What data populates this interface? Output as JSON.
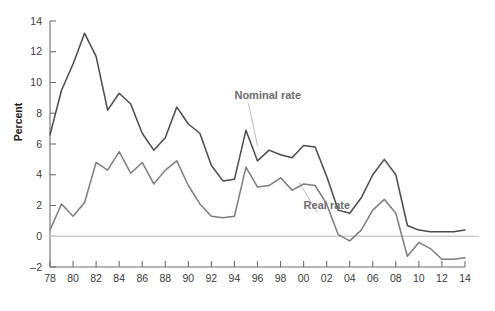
{
  "chart_data": {
    "type": "line",
    "title": "",
    "subtitle": "",
    "xlabel": "",
    "ylabel": "Percent",
    "ylim": [
      -2,
      14
    ],
    "yticks": [
      -2,
      0,
      2,
      4,
      6,
      8,
      10,
      12,
      14
    ],
    "ytick_labels": [
      "–2",
      "0",
      "2",
      "4",
      "6",
      "8",
      "10",
      "12",
      "14"
    ],
    "xlim": [
      1978,
      2014
    ],
    "xticks": [
      1978,
      1980,
      1982,
      1984,
      1986,
      1988,
      1990,
      1992,
      1994,
      1996,
      1998,
      2000,
      2002,
      2004,
      2006,
      2008,
      2010,
      2012,
      2014
    ],
    "xtick_labels": [
      "78",
      "80",
      "82",
      "84",
      "86",
      "88",
      "90",
      "92",
      "94",
      "96",
      "98",
      "00",
      "02",
      "04",
      "06",
      "08",
      "10",
      "12",
      "14"
    ],
    "grid": false,
    "legend_position": "inline-annotation",
    "zero_reference_line": 0,
    "x": [
      1978,
      1979,
      1980,
      1981,
      1982,
      1983,
      1984,
      1985,
      1986,
      1987,
      1988,
      1989,
      1990,
      1991,
      1992,
      1993,
      1994,
      1995,
      1996,
      1997,
      1998,
      1999,
      2000,
      2001,
      2002,
      2003,
      2004,
      2005,
      2006,
      2007,
      2008,
      2009,
      2010,
      2011,
      2012,
      2013,
      2014
    ],
    "series": [
      {
        "name": "Nominal rate",
        "color": "#4a4a4a",
        "values": [
          6.6,
          9.5,
          11.2,
          13.2,
          11.7,
          8.2,
          9.3,
          8.6,
          6.7,
          5.6,
          6.4,
          8.4,
          7.3,
          6.7,
          4.6,
          3.6,
          3.7,
          6.9,
          4.9,
          5.6,
          5.3,
          5.1,
          5.9,
          5.8,
          3.9,
          1.7,
          1.5,
          2.5,
          4.0,
          5.0,
          4.0,
          0.7,
          0.4,
          0.3,
          0.3,
          0.3,
          0.4
        ]
      },
      {
        "name": "Real rate",
        "color": "#7d7d7d",
        "values": [
          0.4,
          2.1,
          1.3,
          2.2,
          4.8,
          4.3,
          5.5,
          4.1,
          4.8,
          3.4,
          4.3,
          4.9,
          3.3,
          2.1,
          1.3,
          1.2,
          1.3,
          4.5,
          3.2,
          3.3,
          3.8,
          3.0,
          3.4,
          3.3,
          2.1,
          0.1,
          -0.3,
          0.4,
          1.7,
          2.4,
          1.5,
          -1.3,
          -0.4,
          -0.8,
          -1.5,
          -1.5,
          -1.4
        ]
      }
    ],
    "annotations": [
      {
        "text": "Nominal rate",
        "x": 1994.0,
        "y": 8.9,
        "leader_to_x": 1996.0,
        "leader_to_y": 5.9
      },
      {
        "text": "Real rate",
        "x": 2000.0,
        "y": 1.8,
        "leader_to_x": 1999.6,
        "leader_to_y": 3.5
      }
    ]
  }
}
